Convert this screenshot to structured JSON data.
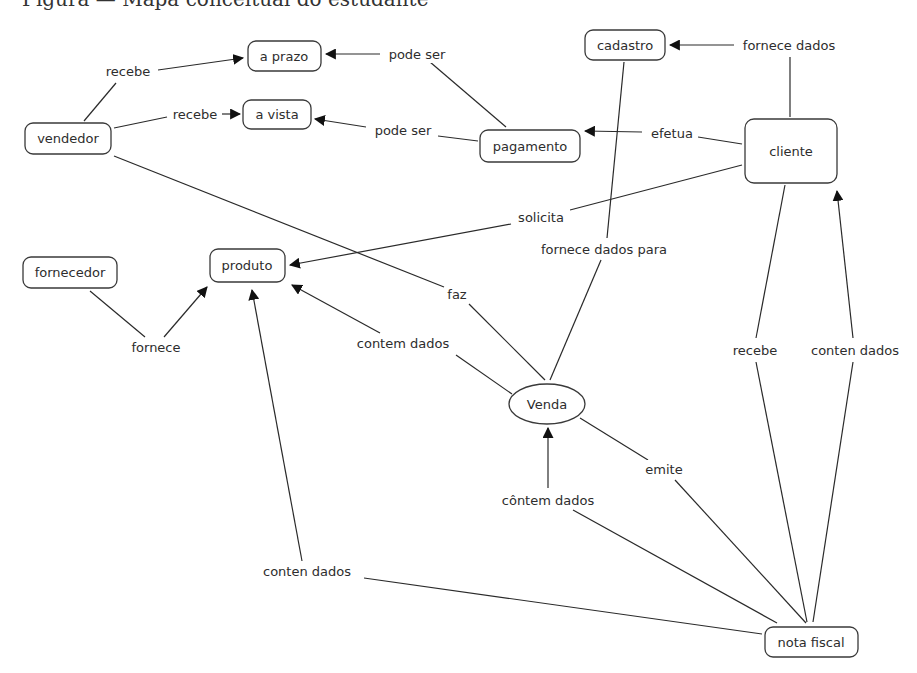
{
  "caption": "Figura — Mapa conceitual do estudante",
  "concepts": {
    "vendedor": "vendedor",
    "a_prazo": "a prazo",
    "a_vista": "a vista",
    "pagamento": "pagamento",
    "cadastro": "cadastro",
    "cliente": "cliente",
    "fornecedor": "fornecedor",
    "produto": "produto",
    "venda": "Venda",
    "nota_fiscal": "nota fiscal"
  },
  "links": {
    "recebe_prazo": "recebe",
    "recebe_vista": "recebe",
    "pode_ser_prazo": "pode ser",
    "pode_ser_vista": "pode ser",
    "fornece_dados": "fornece dados",
    "efetua": "efetua",
    "solicita": "solicita",
    "fornece_dados_para": "fornece dados para",
    "fornece": "fornece",
    "faz": "faz",
    "contem_dados": "contem dados",
    "recebe_cliente": "recebe",
    "conten_dados_cliente": "conten dados",
    "emite": "emite",
    "conten_dados_venda": "côntem dados",
    "conten_dados_produto": "conten dados"
  },
  "relations": [
    {
      "from": "vendedor",
      "link": "recebe",
      "to": "a prazo"
    },
    {
      "from": "vendedor",
      "link": "recebe",
      "to": "a vista"
    },
    {
      "from": "pagamento",
      "link": "pode ser",
      "to": "a prazo"
    },
    {
      "from": "pagamento",
      "link": "pode ser",
      "to": "a vista"
    },
    {
      "from": "cliente",
      "link": "fornece dados",
      "to": "cadastro"
    },
    {
      "from": "cliente",
      "link": "efetua",
      "to": "pagamento"
    },
    {
      "from": "cliente",
      "link": "solicita",
      "to": "produto"
    },
    {
      "from": "cadastro",
      "link": "fornece dados para",
      "to": "Venda"
    },
    {
      "from": "fornecedor",
      "link": "fornece",
      "to": "produto"
    },
    {
      "from": "vendedor",
      "link": "faz",
      "to": "Venda"
    },
    {
      "from": "Venda",
      "link": "contem dados",
      "to": "produto"
    },
    {
      "from": "cliente",
      "link": "recebe",
      "to": "nota fiscal"
    },
    {
      "from": "nota fiscal",
      "link": "conten dados",
      "to": "cliente"
    },
    {
      "from": "Venda",
      "link": "emite",
      "to": "nota fiscal"
    },
    {
      "from": "nota fiscal",
      "link": "côntem dados",
      "to": "Venda"
    },
    {
      "from": "nota fiscal",
      "link": "conten dados",
      "to": "produto"
    }
  ]
}
